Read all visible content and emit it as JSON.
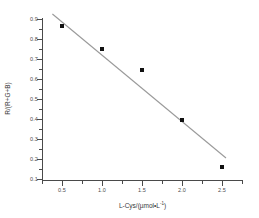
{
  "chart_data": {
    "type": "scatter",
    "title": "",
    "xlabel": "L-Cys/(µmol•L",
    "xlabel_sup": "-1",
    "xlabel_tail": ")",
    "ylabel": "R/(R+G+B)",
    "x": [
      0.5,
      1.0,
      1.5,
      2.0,
      2.5
    ],
    "values": [
      0.867,
      0.752,
      0.645,
      0.397,
      0.162
    ],
    "series": [
      {
        "name": "R/(R+G+B) vs L-Cys",
        "values": [
          0.867,
          0.752,
          0.645,
          0.397,
          0.162
        ]
      }
    ],
    "fit_line": {
      "type": "linear",
      "x_start": 0.38,
      "y_start": 0.925,
      "x_end": 2.55,
      "y_end": 0.205
    },
    "xlim": [
      0.28,
      2.78
    ],
    "ylim": [
      0.1,
      0.94
    ],
    "xticks": [
      "0.5",
      "1.0",
      "1.5",
      "2.0",
      "2.5"
    ],
    "xtick_values": [
      0.5,
      1.0,
      1.5,
      2.0,
      2.5
    ],
    "yticks": [
      "0.9",
      "0.8",
      "0.7",
      "0.6",
      "0.5",
      "0.4",
      "0.3",
      "0.2",
      "0.1"
    ],
    "ytick_values": [
      0.9,
      0.8,
      0.7,
      0.6,
      0.5,
      0.4,
      0.3,
      0.2,
      0.1
    ],
    "grid": false,
    "legend": null,
    "marker": "filled-square",
    "marker_color": "#111111",
    "line_color": "#9a9a9a",
    "axis_color": "#4a4a4a",
    "background": "#ffffff"
  }
}
